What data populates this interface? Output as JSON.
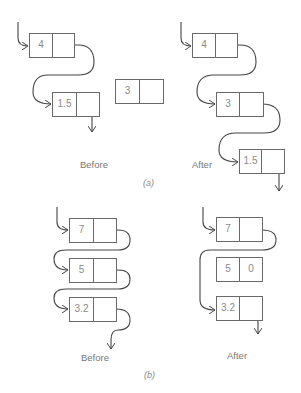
{
  "figure_a": {
    "label": "(a)",
    "before": {
      "caption": "Before",
      "nodes": [
        {
          "value": "4",
          "next": "pointer"
        },
        {
          "value": "1.5",
          "next": "pointer"
        }
      ],
      "free_node": {
        "value": "3",
        "next": ""
      }
    },
    "after": {
      "caption": "After",
      "nodes": [
        {
          "value": "4",
          "next": "pointer"
        },
        {
          "value": "3",
          "next": "pointer"
        },
        {
          "value": "1.5",
          "next": "pointer"
        }
      ]
    }
  },
  "figure_b": {
    "label": "(b)",
    "before": {
      "caption": "Before",
      "nodes": [
        {
          "value": "7",
          "next": "pointer"
        },
        {
          "value": "5",
          "next": "pointer"
        },
        {
          "value": "3.2",
          "next": "pointer"
        }
      ]
    },
    "after": {
      "caption": "After",
      "nodes": [
        {
          "value": "7",
          "next": "pointer"
        },
        {
          "value": "5",
          "next": "0"
        },
        {
          "value": "3.2",
          "next": "pointer"
        }
      ]
    }
  }
}
